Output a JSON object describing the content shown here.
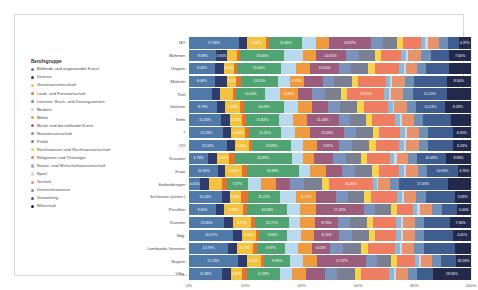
{
  "legend": {
    "title": "Berufsgruppe",
    "items": [
      {
        "label": "Bildende und angewandte Kunst",
        "color": "#4e79a8"
      },
      {
        "label": "Diverse",
        "color": "#2f3b6b"
      },
      {
        "label": "Geisteswissenschaft",
        "color": "#f3c340"
      },
      {
        "label": "Land- und Forstwirtschaft",
        "color": "#e8722c"
      },
      {
        "label": "Literatur, Buch- und Zeitungswesen",
        "color": "#4fa472"
      },
      {
        "label": "Medizin",
        "color": "#b8d9ee"
      },
      {
        "label": "Militär",
        "color": "#ef9a3f"
      },
      {
        "label": "Musik und darstellende Kunst",
        "color": "#9c5d7c"
      },
      {
        "label": "Naturwissenschaft",
        "color": "#7b92bc"
      },
      {
        "label": "Politik",
        "color": "#7b7f92"
      },
      {
        "label": "Rechtswesen und Rechtswissenschaft",
        "color": "#f7d44c"
      },
      {
        "label": "Religionen und Theologie",
        "color": "#ef7d62"
      },
      {
        "label": "Sozial- und Wirtschaftswissenschaft",
        "color": "#8fb8d6"
      },
      {
        "label": "Sport",
        "color": "#cdd8e6"
      },
      {
        "label": "Technik",
        "color": "#e8936b"
      },
      {
        "label": "Unterrichtswesen",
        "color": "#6f8fb5"
      },
      {
        "label": "Verwaltung",
        "color": "#3f5d8f"
      },
      {
        "label": "Wirtschaft",
        "color": "#22294b"
      }
    ]
  },
  "axis": {
    "ticks": [
      "0%",
      "20%",
      "40%",
      "60%",
      "80%",
      "100%"
    ],
    "values": [
      0,
      20,
      40,
      60,
      80,
      100
    ]
  },
  "chart_data": {
    "type": "bar",
    "orientation": "horizontal",
    "stacked": true,
    "normalized": true,
    "title": "",
    "xlabel": "",
    "ylabel": "",
    "xlim": [
      0,
      100
    ],
    "grid": true,
    "legend_position": "left",
    "categories": [
      "NÖ",
      "Böhmen",
      "Ungarn",
      "Mähren",
      "Tirol",
      "Galizien",
      "Stmk",
      "?",
      "OÖ",
      "Kroatien",
      "Krain",
      "Siebenbürgen",
      "Schlesien (österr.)",
      "Preußen",
      "Kärnten",
      "Sbg.",
      "Lombardo-Venetien",
      "Bayern",
      "Vlbg."
    ],
    "series": [
      {
        "name": "Bildende und angewandte Kunst",
        "color": "#4e79a8",
        "values": [
          17.66,
          9.69,
          9.2,
          9.08,
          8.33,
          9.79,
          11.3,
          12.19,
          13.32,
          6.78,
          10.36,
          4.0,
          11.16,
          9.6,
          12.9,
          15.67,
          13.79,
          17.23,
          11.83
        ]
      },
      {
        "name": "Diverse",
        "color": "#2f3b6b",
        "values": [
          3.1,
          3.6,
          3.1,
          4.5,
          2.6,
          3.1,
          3.1,
          2.8,
          2.9,
          3.3,
          2.5,
          3.1,
          2.8,
          3.0,
          3.4,
          3.0,
          3.1,
          3.2,
          3.0
        ]
      },
      {
        "name": "Geisteswissenschaft",
        "color": "#f3c340",
        "values": [
          6.6,
          3.52,
          3.6,
          3.2,
          4.6,
          5.15,
          4.3,
          5.0,
          5.0,
          4.3,
          6.0,
          4.5,
          3.9,
          6.66,
          6.57,
          5.0,
          5.77,
          5.01,
          4.15
        ]
      },
      {
        "name": "Land- und Forstwirtschaft",
        "color": "#e8722c",
        "values": [
          1.2,
          1.3,
          1.1,
          1.6,
          1.3,
          1.4,
          1.5,
          1.3,
          1.2,
          1.9,
          1.5,
          1.8,
          2.2,
          1.5,
          1.4,
          1.2,
          1.4,
          1.3,
          1.7
        ]
      },
      {
        "name": "Literatur, Buch- und Zeitungswesen",
        "color": "#4fa472",
        "values": [
          11.66,
          15.66,
          15.56,
          13.15,
          10.26,
          14.28,
          11.82,
          11.41,
          13.69,
          20.35,
          18.39,
          7.57,
          11.22,
          14.08,
          12.71,
          9.68,
          9.97,
          8.99,
          11.59
        ]
      },
      {
        "name": "Medizin",
        "color": "#b8d9ee",
        "values": [
          4.9,
          6.6,
          5.3,
          4.2,
          5.3,
          4.9,
          4.8,
          5.0,
          4.5,
          3.9,
          4.1,
          4.8,
          5.4,
          4.6,
          4.2,
          5.3,
          4.5,
          4.7,
          4.5
        ]
      },
      {
        "name": "Militär",
        "color": "#ef9a3f",
        "values": [
          4.6,
          4.4,
          5.2,
          4.9,
          6.39,
          5.0,
          4.9,
          5.3,
          4.9,
          4.2,
          5.7,
          5.1,
          6.77,
          5.6,
          5.3,
          4.6,
          5.0,
          5.1,
          5.0
        ]
      },
      {
        "name": "Musik und darstellende Kunst",
        "color": "#9c5d7c",
        "values": [
          14.97,
          10.61,
          10.0,
          6.73,
          4.95,
          5.7,
          11.44,
          12.05,
          7.61,
          6.65,
          5.7,
          5.3,
          6.77,
          17.2,
          8.73,
          8.7,
          6.62,
          17.37,
          6.5
        ]
      },
      {
        "name": "Naturwissenschaft",
        "color": "#7b92bc",
        "values": [
          4.1,
          4.6,
          4.3,
          4.0,
          4.7,
          4.2,
          4.0,
          4.3,
          4.6,
          4.5,
          4.4,
          4.9,
          4.1,
          4.0,
          4.3,
          4.6,
          4.4,
          3.9,
          4.4
        ]
      },
      {
        "name": "Politik",
        "color": "#7b7f92",
        "values": [
          5.3,
          5.7,
          6.2,
          6.3,
          5.6,
          6.0,
          5.6,
          5.8,
          6.1,
          5.5,
          5.9,
          6.4,
          5.7,
          5.5,
          6.2,
          5.9,
          6.6,
          4.9,
          6.3
        ]
      },
      {
        "name": "Rechtswesen und Rechtswissenschaft",
        "color": "#f7d44c",
        "values": [
          2.1,
          2.3,
          2.5,
          2.4,
          2.2,
          2.6,
          2.2,
          2.3,
          2.4,
          2.2,
          2.5,
          2.6,
          2.2,
          2.1,
          2.4,
          2.3,
          2.5,
          2.0,
          2.4
        ]
      },
      {
        "name": "Religionen und Theologie",
        "color": "#ef7d62",
        "values": [
          6.1,
          7.1,
          8.3,
          9.6,
          13.2,
          8.4,
          8.2,
          7.3,
          8.4,
          8.0,
          7.2,
          15.4,
          9.0,
          5.9,
          8.6,
          7.4,
          9.6,
          6.3,
          9.8
        ]
      },
      {
        "name": "Sozial- und Wirtschaftswissenschaft",
        "color": "#8fb8d6",
        "values": [
          1.6,
          1.7,
          1.8,
          1.5,
          1.6,
          1.7,
          1.6,
          1.7,
          1.7,
          1.6,
          1.7,
          1.5,
          1.6,
          1.5,
          1.7,
          1.6,
          1.7,
          1.5,
          1.7
        ]
      },
      {
        "name": "Sport",
        "color": "#cdd8e6",
        "values": [
          0.9,
          0.8,
          0.7,
          0.8,
          0.7,
          0.7,
          0.8,
          0.8,
          0.7,
          0.9,
          0.7,
          0.6,
          0.8,
          0.9,
          0.8,
          0.9,
          0.7,
          0.8,
          0.7
        ]
      },
      {
        "name": "Technik",
        "color": "#e8936b",
        "values": [
          4.2,
          4.5,
          4.1,
          4.6,
          4.3,
          4.4,
          4.3,
          4.2,
          4.5,
          4.0,
          4.3,
          4.0,
          4.2,
          4.5,
          4.4,
          4.3,
          4.2,
          4.0,
          4.4
        ]
      },
      {
        "name": "Unterrichtswesen",
        "color": "#6f8fb5",
        "values": [
          3.1,
          3.4,
          3.2,
          3.3,
          3.5,
          3.3,
          3.2,
          3.4,
          3.3,
          3.1,
          3.4,
          3.2,
          3.3,
          3.4,
          3.3,
          3.2,
          3.4,
          3.1,
          3.3
        ]
      },
      {
        "name": "Verwaltung",
        "color": "#3f5d8f",
        "values": [
          3.73,
          6.62,
          8.03,
          11.54,
          12.2,
          10.13,
          9.75,
          8.65,
          9.03,
          10.49,
          10.65,
          17.43,
          9.76,
          5.25,
          9.76,
          10.35,
          11.04,
          5.25,
          5.49
        ]
      },
      {
        "name": "Wirtschaft",
        "color": "#22294b",
        "values": [
          4.37,
          7.6,
          7.8,
          8.5,
          8.5,
          9.28,
          7.2,
          6.5,
          6.23,
          8.83,
          4.7,
          8.3,
          5.59,
          5.0,
          7.56,
          6.19,
          5.74,
          5.34,
          13.53
        ]
      }
    ],
    "visible_labels": {
      "NÖ": {
        "Bildende und angewandte Kunst": "17.66%",
        "Geisteswissenschaft": "6.60%",
        "Literatur, Buch- und Zeitungswesen": "11.66%",
        "Musik und darstellende Kunst": "14.97%",
        "Wirtschaft": "4.37%"
      },
      "Böhmen": {
        "Bildende und angewandte Kunst": "9.69%",
        "Diverse": "3.60%",
        "Literatur, Buch- und Zeitungswesen": "15.66%",
        "Musik und darstellende Kunst": "10.61%",
        "Wirtschaft": "7.60%"
      },
      "Ungarn": {
        "Bildende und angewandte Kunst": "9.20%",
        "Geisteswissenschaft": "3.60%",
        "Literatur, Buch- und Zeitungswesen": "15.56%",
        "Musik und darstellende Kunst": "10.00%"
      },
      "Mähren": {
        "Bildende und angewandte Kunst": "9.08%",
        "Geisteswissenschaft": "3.20%",
        "Literatur, Buch- und Zeitungswesen": "13.15%",
        "Militär": "6.73%",
        "Wirtschaft": "8.50%"
      },
      "Tirol": {
        "Literatur, Buch- und Zeitungswesen": "10.26%",
        "Militär": "6.39%",
        "Religionen und Theologie": "13.20%",
        "Verwaltung": "12.20%"
      },
      "Galizien": {
        "Bildende und angewandte Kunst": "9.79%",
        "Geisteswissenschaft": "5.15%",
        "Literatur, Buch- und Zeitungswesen": "14.28%",
        "Verwaltung": "10.13%",
        "Wirtschaft": "9.28%"
      },
      "Stmk": {
        "Bildende und angewandte Kunst": "11.30%",
        "Geisteswissenschaft": "4.30%",
        "Literatur, Buch- und Zeitungswesen": "11.82%",
        "Musik und darstellende Kunst": "11.44%"
      },
      "?": {
        "Bildende und angewandte Kunst": "12.19%",
        "Geisteswissenschaft": "5.00%",
        "Literatur, Buch- und Zeitungswesen": "11.41%",
        "Musik und darstellende Kunst": "12.05%",
        "Wirtschaft": "6.50%"
      },
      "OÖ": {
        "Bildende und angewandte Kunst": "13.32%",
        "Geisteswissenschaft": "5.00%",
        "Literatur, Buch- und Zeitungswesen": "13.69%",
        "Musik und darstellende Kunst": "7.61%",
        "Wirtschaft": "6.23%"
      },
      "Kroatien": {
        "Bildende und angewandte Kunst": "6.78%",
        "Geisteswissenschaft": "4.30%",
        "Literatur, Buch- und Zeitungswesen": "20.35%",
        "Verwaltung": "10.49%",
        "Wirtschaft": "8.83%"
      },
      "Krain": {
        "Bildende und angewandte Kunst": "10.36%",
        "Geisteswissenschaft": "6.00%",
        "Literatur, Buch- und Zeitungswesen": "18.39%",
        "Verwaltung": "10.65%",
        "Wirtschaft": "4.70%"
      },
      "Siebenbürgen": {
        "Bildende und angewandte Kunst": "4.00%",
        "Literatur, Buch- und Zeitungswesen": "7.57%",
        "Religionen und Theologie": "15.40%",
        "Verwaltung": "17.43%"
      },
      "Schlesien (österr.)": {
        "Bildende und angewandte Kunst": "11.16%",
        "Geisteswissenschaft": "3.90%",
        "Literatur, Buch- und Zeitungswesen": "11.22%",
        "Militär": "6.77%",
        "Wirtschaft": "5.59%"
      },
      "Preußen": {
        "Bildende und angewandte Kunst": "9.60%",
        "Geisteswissenschaft": "6.66%",
        "Literatur, Buch- und Zeitungswesen": "14.08%",
        "Musik und darstellende Kunst": "17.20%",
        "Wirtschaft": "5.00%"
      },
      "Kärnten": {
        "Bildende und angewandte Kunst": "12.90%",
        "Geisteswissenschaft": "6.57%",
        "Literatur, Buch- und Zeitungswesen": "12.71%",
        "Musik und darstellende Kunst": "8.73%",
        "Wirtschaft": "7.56%"
      },
      "Sbg.": {
        "Bildende und angewandte Kunst": "15.67%",
        "Geisteswissenschaft": "5.00%",
        "Literatur, Buch- und Zeitungswesen": "9.68%",
        "Musik und darstellende Kunst": "8.70%",
        "Wirtschaft": "4.41%"
      },
      "Lombardo-Venetien": {
        "Bildende und angewandte Kunst": "13.79%",
        "Geisteswissenschaft": "5.77%",
        "Literatur, Buch- und Zeitungswesen": "9.97%",
        "Musik und darstellende Kunst": "6.62%"
      },
      "Bayern": {
        "Bildende und angewandte Kunst": "17.23%",
        "Geisteswissenschaft": "5.01%",
        "Literatur, Buch- und Zeitungswesen": "8.99%",
        "Musik und darstellende Kunst": "17.37%",
        "Wirtschaft": "18.18%"
      },
      "Vlbg.": {
        "Bildende und angewandte Kunst": "11.83%",
        "Geisteswissenschaft": "4.15%",
        "Literatur, Buch- und Zeitungswesen": "11.59%",
        "Wirtschaft": "19.53%"
      }
    }
  }
}
